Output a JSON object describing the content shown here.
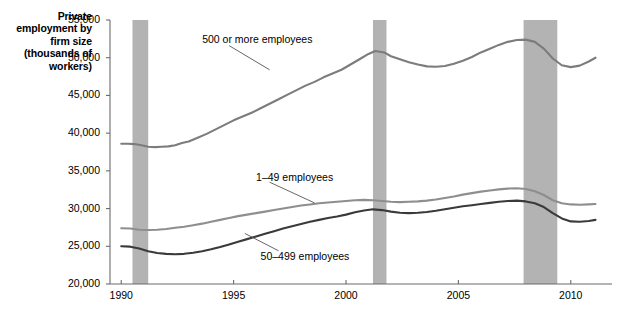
{
  "chart_data": {
    "type": "line",
    "title": "",
    "ylabel": "Private employment by firm size (thousands of workers)",
    "xlabel": "",
    "ylim": [
      20000,
      55000
    ],
    "xlim": [
      1989.5,
      2011.3
    ],
    "grid": false,
    "legend_position": "inline-annotations",
    "ytick_labels": [
      "55,000",
      "50,000",
      "45,000",
      "40,000",
      "35,000",
      "30,000",
      "25,000",
      "20,000"
    ],
    "ytick_values": [
      55000,
      50000,
      45000,
      40000,
      35000,
      30000,
      25000,
      20000
    ],
    "xtick_labels": [
      "1990",
      "1995",
      "2000",
      "2005",
      "2010"
    ],
    "xtick_values": [
      1990,
      1995,
      2000,
      2005,
      2010
    ],
    "annotations": [
      {
        "name": "recession-band-1",
        "label": "",
        "x_start": 1990.5,
        "x_end": 1991.2
      },
      {
        "name": "recession-band-2",
        "label": "",
        "x_start": 2001.2,
        "x_end": 2001.8
      },
      {
        "name": "recession-band-3",
        "label": "",
        "x_start": 2007.9,
        "x_end": 2009.4
      }
    ],
    "series": [
      {
        "name": "500 or more employees",
        "color": "#7c7c7c",
        "label_x": 1993.6,
        "label_y": 52300,
        "x": [
          1990.0,
          1990.3,
          1990.6,
          1990.9,
          1991.2,
          1991.5,
          1991.8,
          1992.1,
          1992.4,
          1992.7,
          1993.0,
          1993.4,
          1993.8,
          1994.2,
          1994.6,
          1995.0,
          1995.4,
          1995.8,
          1996.2,
          1996.6,
          1997.0,
          1997.4,
          1997.8,
          1998.2,
          1998.6,
          1999.0,
          1999.4,
          1999.8,
          2000.2,
          2000.6,
          2001.0,
          2001.3,
          2001.7,
          2002.0,
          2002.4,
          2002.8,
          2003.2,
          2003.6,
          2004.0,
          2004.4,
          2004.8,
          2005.2,
          2005.6,
          2006.0,
          2006.4,
          2006.8,
          2007.2,
          2007.6,
          2008.0,
          2008.4,
          2008.8,
          2009.2,
          2009.6,
          2010.0,
          2010.4,
          2010.8,
          2011.1
        ],
        "y": [
          38600,
          38600,
          38550,
          38400,
          38200,
          38150,
          38200,
          38250,
          38400,
          38700,
          38900,
          39400,
          39900,
          40500,
          41100,
          41700,
          42200,
          42700,
          43300,
          43900,
          44500,
          45100,
          45700,
          46300,
          46800,
          47400,
          47900,
          48400,
          49100,
          49800,
          50500,
          50900,
          50700,
          50200,
          49800,
          49400,
          49100,
          48850,
          48800,
          48900,
          49200,
          49600,
          50100,
          50700,
          51200,
          51700,
          52100,
          52350,
          52400,
          52100,
          51200,
          49900,
          49000,
          48750,
          48950,
          49500,
          50000
        ]
      },
      {
        "name": "1–49 employees",
        "color": "#8e8e8e",
        "label_x": 1996.0,
        "label_y": 34100,
        "x": [
          1990.0,
          1990.4,
          1990.8,
          1991.2,
          1991.6,
          1992.0,
          1992.4,
          1992.8,
          1993.2,
          1993.6,
          1994.0,
          1994.4,
          1994.8,
          1995.2,
          1995.6,
          1996.0,
          1996.4,
          1996.8,
          1997.2,
          1997.6,
          1998.0,
          1998.4,
          1998.8,
          1999.2,
          1999.6,
          2000.0,
          2000.4,
          2000.8,
          2001.2,
          2001.6,
          2002.0,
          2002.4,
          2002.8,
          2003.2,
          2003.6,
          2004.0,
          2004.4,
          2004.8,
          2005.2,
          2005.6,
          2006.0,
          2006.4,
          2006.8,
          2007.2,
          2007.6,
          2008.0,
          2008.4,
          2008.8,
          2009.2,
          2009.6,
          2010.0,
          2010.4,
          2010.8,
          2011.1
        ],
        "y": [
          27400,
          27350,
          27200,
          27150,
          27200,
          27300,
          27450,
          27600,
          27800,
          28000,
          28250,
          28500,
          28750,
          29000,
          29200,
          29400,
          29600,
          29800,
          30000,
          30200,
          30400,
          30550,
          30700,
          30800,
          30900,
          31000,
          31100,
          31150,
          31100,
          31000,
          30900,
          30850,
          30900,
          30950,
          31050,
          31200,
          31400,
          31600,
          31850,
          32050,
          32250,
          32400,
          32550,
          32650,
          32700,
          32600,
          32300,
          31800,
          31100,
          30700,
          30550,
          30500,
          30550,
          30600
        ]
      },
      {
        "name": "50–499 employees",
        "color": "#3a3a3a",
        "label_x": 1996.2,
        "label_y": 23600,
        "x": [
          1990.0,
          1990.4,
          1990.8,
          1991.2,
          1991.6,
          1992.0,
          1992.4,
          1992.8,
          1993.2,
          1993.6,
          1994.0,
          1994.4,
          1994.8,
          1995.2,
          1995.6,
          1996.0,
          1996.4,
          1996.8,
          1997.2,
          1997.6,
          1998.0,
          1998.4,
          1998.8,
          1999.2,
          1999.6,
          2000.0,
          2000.4,
          2000.8,
          2001.2,
          2001.6,
          2002.0,
          2002.4,
          2002.8,
          2003.2,
          2003.6,
          2004.0,
          2004.4,
          2004.8,
          2005.2,
          2005.6,
          2006.0,
          2006.4,
          2006.8,
          2007.2,
          2007.6,
          2008.0,
          2008.4,
          2008.8,
          2009.2,
          2009.6,
          2010.0,
          2010.4,
          2010.8,
          2011.1
        ],
        "y": [
          25000,
          24950,
          24700,
          24350,
          24100,
          24000,
          23950,
          24000,
          24150,
          24350,
          24600,
          24900,
          25250,
          25600,
          25950,
          26300,
          26650,
          27000,
          27350,
          27650,
          27950,
          28250,
          28500,
          28750,
          28950,
          29200,
          29500,
          29750,
          29900,
          29800,
          29600,
          29450,
          29400,
          29450,
          29550,
          29700,
          29900,
          30100,
          30300,
          30450,
          30600,
          30750,
          30900,
          31000,
          31050,
          30950,
          30700,
          30200,
          29400,
          28700,
          28300,
          28250,
          28350,
          28500
        ]
      }
    ],
    "leader_lines": [
      {
        "name": "leader-500-or-more",
        "x1": 1994.8,
        "y1": 51600,
        "x2": 1996.6,
        "y2": 48400
      },
      {
        "name": "leader-1-49",
        "x1": 1996.6,
        "y1": 33500,
        "x2": 1998.6,
        "y2": 30750
      },
      {
        "name": "leader-50-499",
        "x1": 1997.0,
        "y1": 24400,
        "x2": 1995.5,
        "y2": 26700
      }
    ]
  },
  "colors": {
    "recession_band": "#b3b3b3",
    "axis": "#6b6b6b",
    "text": "#000000",
    "series_500_plus": "#7c7c7c",
    "series_1_49": "#8e8e8e",
    "series_50_499": "#3a3a3a"
  }
}
